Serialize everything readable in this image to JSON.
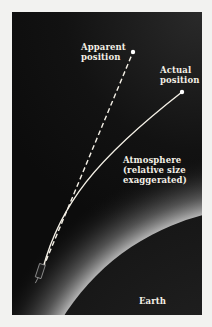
{
  "diagram": {
    "labels": {
      "apparent": [
        "Apparent",
        "position"
      ],
      "actual": [
        "Actual",
        "position"
      ],
      "atmosphere": [
        "Atmosphere",
        "(relative size",
        "exaggerated)"
      ],
      "earth": "Earth"
    },
    "elements": [
      {
        "name": "apparent-star",
        "x": 133,
        "y": 52,
        "style": "dot"
      },
      {
        "name": "actual-star",
        "x": 182,
        "y": 92,
        "style": "dot"
      },
      {
        "name": "apparent-line",
        "style": "dashed",
        "from": [
          43,
          268
        ],
        "to": [
          133,
          52
        ]
      },
      {
        "name": "actual-path",
        "style": "solid-curve",
        "from": [
          43,
          268
        ],
        "to": [
          182,
          92
        ]
      },
      {
        "name": "telescope",
        "x": 40,
        "y": 270
      },
      {
        "name": "earth-surface",
        "shape": "circle-arc"
      },
      {
        "name": "atmosphere-glow",
        "shape": "gradient-band"
      }
    ],
    "colors": {
      "background": "#0e0e0e",
      "earth": "#1a1a1a",
      "glow": "#bdbdbd",
      "line": "#f4f0e6",
      "page": "#f2f2f0"
    }
  }
}
